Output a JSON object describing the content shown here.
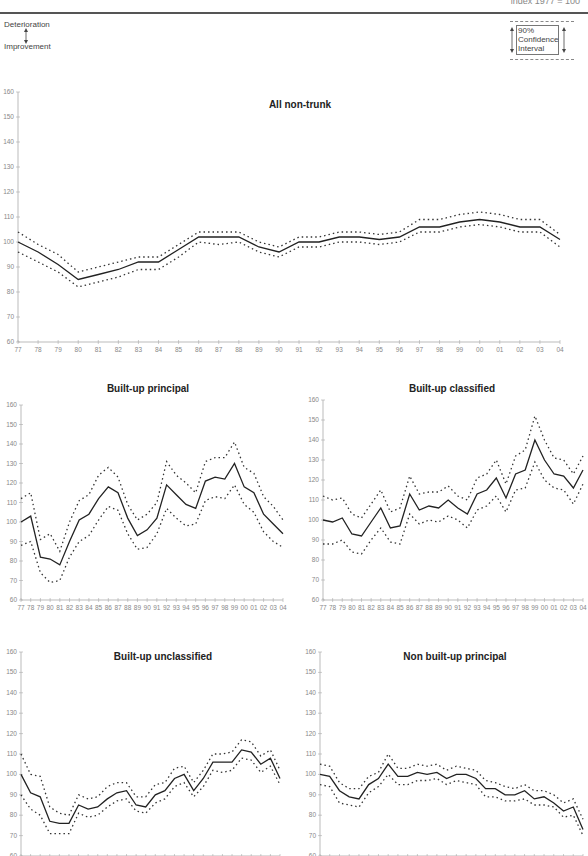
{
  "header": {
    "page_text": "index 1977 = 100"
  },
  "legend": {
    "deterioration_label": "Deterioration",
    "improvement_label": "Improvement",
    "ci_line1": "90%",
    "ci_line2": "Confidence",
    "ci_line3": "Interval"
  },
  "colors": {
    "line": "#222222",
    "ci": "#333333",
    "axis": "#aaaaaa"
  },
  "chart_data": [
    {
      "id": "all-non-trunk",
      "type": "line",
      "title": "All non-trunk",
      "xlabel": "",
      "ylabel": "",
      "ylim": [
        60,
        160
      ],
      "yticks": [
        60,
        70,
        80,
        90,
        100,
        110,
        120,
        130,
        140,
        150,
        160
      ],
      "categories": [
        "77",
        "78",
        "79",
        "80",
        "81",
        "82",
        "83",
        "84",
        "85",
        "86",
        "87",
        "88",
        "89",
        "90",
        "91",
        "92",
        "93",
        "94",
        "95",
        "96",
        "97",
        "98",
        "99",
        "00",
        "01",
        "02",
        "03",
        "04"
      ],
      "series": [
        {
          "name": "Index",
          "values": [
            100,
            96,
            91,
            85,
            87,
            89,
            92,
            92,
            97,
            102,
            102,
            102,
            98,
            96,
            100,
            100,
            102,
            102,
            101,
            102,
            106,
            106,
            108,
            109,
            108,
            106,
            106,
            101
          ]
        },
        {
          "name": "Upper 90% CI",
          "values": [
            104,
            99,
            95,
            88,
            90,
            92,
            94,
            94,
            99,
            104,
            104,
            104,
            100,
            98,
            102,
            102,
            104,
            104,
            103,
            104,
            109,
            109,
            111,
            112,
            111,
            109,
            109,
            103
          ]
        },
        {
          "name": "Lower 90% CI",
          "values": [
            96,
            92,
            88,
            82,
            84,
            86,
            89,
            89,
            94,
            100,
            99,
            100,
            96,
            94,
            98,
            98,
            100,
            100,
            99,
            100,
            104,
            104,
            106,
            107,
            106,
            104,
            104,
            98
          ]
        }
      ],
      "grid": false
    },
    {
      "id": "built-up-principal",
      "type": "line",
      "title": "Built-up principal",
      "ylim": [
        60,
        160
      ],
      "yticks": [
        60,
        70,
        80,
        90,
        100,
        110,
        120,
        130,
        140,
        150,
        160
      ],
      "categories": [
        "77",
        "78",
        "79",
        "80",
        "81",
        "82",
        "83",
        "84",
        "85",
        "86",
        "87",
        "88",
        "89",
        "90",
        "91",
        "92",
        "93",
        "94",
        "95",
        "96",
        "97",
        "98",
        "99",
        "00",
        "01",
        "02",
        "03",
        "04"
      ],
      "series": [
        {
          "name": "Index",
          "values": [
            100,
            103,
            82,
            81,
            78,
            90,
            101,
            104,
            112,
            118,
            115,
            102,
            93,
            96,
            102,
            119,
            114,
            109,
            107,
            121,
            123,
            122,
            130,
            118,
            115,
            104,
            99,
            94
          ]
        },
        {
          "name": "Upper 90% CI",
          "values": [
            112,
            115,
            91,
            94,
            85,
            100,
            111,
            114,
            124,
            128,
            123,
            109,
            101,
            104,
            110,
            131,
            124,
            120,
            115,
            131,
            133,
            133,
            141,
            128,
            125,
            113,
            108,
            101
          ]
        },
        {
          "name": "Lower 90% CI",
          "values": [
            88,
            90,
            74,
            69,
            70,
            82,
            90,
            93,
            101,
            108,
            106,
            94,
            86,
            87,
            94,
            107,
            102,
            98,
            99,
            111,
            113,
            112,
            119,
            109,
            105,
            95,
            90,
            87
          ]
        }
      ]
    },
    {
      "id": "built-up-classified",
      "type": "line",
      "title": "Built-up classified",
      "ylim": [
        60,
        160
      ],
      "yticks": [
        60,
        70,
        80,
        90,
        100,
        110,
        120,
        130,
        140,
        150,
        160
      ],
      "categories": [
        "77",
        "78",
        "79",
        "80",
        "81",
        "82",
        "83",
        "84",
        "85",
        "86",
        "87",
        "88",
        "89",
        "90",
        "91",
        "92",
        "93",
        "94",
        "95",
        "96",
        "97",
        "98",
        "99",
        "00",
        "01",
        "02",
        "03",
        "04"
      ],
      "series": [
        {
          "name": "Index",
          "values": [
            100,
            99,
            101,
            93,
            92,
            99,
            106,
            96,
            97,
            113,
            105,
            107,
            106,
            110,
            106,
            103,
            113,
            115,
            121,
            111,
            123,
            125,
            140,
            130,
            123,
            122,
            116,
            125
          ]
        },
        {
          "name": "Upper 90% CI",
          "values": [
            112,
            110,
            111,
            103,
            101,
            108,
            115,
            104,
            106,
            122,
            113,
            114,
            114,
            117,
            112,
            110,
            121,
            123,
            130,
            118,
            132,
            135,
            152,
            140,
            131,
            130,
            123,
            132
          ]
        },
        {
          "name": "Lower 90% CI",
          "values": [
            88,
            88,
            90,
            84,
            83,
            90,
            96,
            89,
            88,
            103,
            98,
            100,
            99,
            102,
            100,
            96,
            105,
            107,
            112,
            104,
            115,
            116,
            129,
            120,
            116,
            115,
            108,
            118
          ]
        }
      ]
    },
    {
      "id": "built-up-unclassified",
      "type": "line",
      "title": "Built-up unclassified",
      "ylim": [
        60,
        160
      ],
      "yticks": [
        60,
        70,
        80,
        90,
        100,
        110,
        120,
        130,
        140,
        150,
        160
      ],
      "categories": [
        "77",
        "78",
        "79",
        "80",
        "81",
        "82",
        "83",
        "84",
        "85",
        "86",
        "87",
        "88",
        "89",
        "90",
        "91",
        "92",
        "93",
        "94",
        "95",
        "96",
        "97",
        "98",
        "99",
        "00",
        "01",
        "02",
        "03",
        "04"
      ],
      "series": [
        {
          "name": "Index",
          "values": [
            100,
            91,
            89,
            77,
            76,
            76,
            85,
            83,
            84,
            88,
            91,
            92,
            85,
            84,
            90,
            92,
            98,
            100,
            92,
            98,
            106,
            106,
            106,
            112,
            111,
            105,
            108,
            98
          ]
        },
        {
          "name": "Upper 90% CI",
          "values": [
            110,
            100,
            99,
            84,
            81,
            80,
            90,
            88,
            89,
            94,
            96,
            96,
            89,
            89,
            95,
            96,
            103,
            104,
            96,
            102,
            110,
            110,
            111,
            117,
            116,
            109,
            112,
            102
          ]
        },
        {
          "name": "Lower 90% CI",
          "values": [
            90,
            83,
            80,
            71,
            71,
            71,
            81,
            79,
            80,
            84,
            87,
            88,
            82,
            81,
            86,
            88,
            94,
            96,
            89,
            94,
            102,
            101,
            102,
            108,
            107,
            101,
            104,
            95
          ]
        }
      ]
    },
    {
      "id": "non-built-up-principal",
      "type": "line",
      "title": "Non built-up principal",
      "ylim": [
        60,
        160
      ],
      "yticks": [
        60,
        70,
        80,
        90,
        100,
        110,
        120,
        130,
        140,
        150,
        160
      ],
      "categories": [
        "77",
        "78",
        "79",
        "80",
        "81",
        "82",
        "83",
        "84",
        "85",
        "86",
        "87",
        "88",
        "89",
        "90",
        "91",
        "92",
        "93",
        "94",
        "95",
        "96",
        "97",
        "98",
        "99",
        "00",
        "01",
        "02",
        "03",
        "04"
      ],
      "series": [
        {
          "name": "Index",
          "values": [
            100,
            99,
            92,
            89,
            88,
            95,
            98,
            105,
            99,
            99,
            101,
            100,
            101,
            98,
            100,
            100,
            98,
            93,
            93,
            90,
            90,
            92,
            88,
            89,
            86,
            82,
            84,
            73
          ]
        },
        {
          "name": "Upper 90% CI",
          "values": [
            105,
            104,
            96,
            93,
            93,
            99,
            101,
            110,
            103,
            103,
            105,
            104,
            105,
            102,
            104,
            103,
            102,
            97,
            96,
            94,
            93,
            95,
            92,
            92,
            90,
            86,
            88,
            78
          ]
        },
        {
          "name": "Lower 90% CI",
          "values": [
            95,
            94,
            86,
            85,
            84,
            91,
            94,
            100,
            95,
            95,
            97,
            97,
            98,
            95,
            97,
            96,
            95,
            89,
            89,
            87,
            87,
            88,
            85,
            85,
            84,
            79,
            80,
            70
          ]
        }
      ]
    }
  ]
}
